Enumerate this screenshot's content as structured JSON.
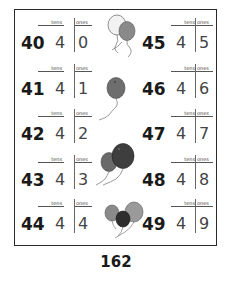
{
  "worksheet": {
    "column_headers": {
      "tens": "tens",
      "ones": "ones"
    },
    "left_column": [
      {
        "number": "40",
        "tens": "4",
        "ones": "0"
      },
      {
        "number": "41",
        "tens": "4",
        "ones": "1"
      },
      {
        "number": "42",
        "tens": "4",
        "ones": "2"
      },
      {
        "number": "43",
        "tens": "4",
        "ones": "3"
      },
      {
        "number": "44",
        "tens": "4",
        "ones": "4"
      }
    ],
    "right_column": [
      {
        "number": "45",
        "tens": "4",
        "ones": "5"
      },
      {
        "number": "46",
        "tens": "4",
        "ones": "6"
      },
      {
        "number": "47",
        "tens": "4",
        "ones": "7"
      },
      {
        "number": "48",
        "tens": "4",
        "ones": "8"
      },
      {
        "number": "49",
        "tens": "4",
        "ones": "9"
      }
    ],
    "illustrations": [
      "balloons-pair-top",
      "balloon-single",
      "balloons-pair-middle",
      "balloons-trio-bottom"
    ]
  },
  "page_number": "162"
}
